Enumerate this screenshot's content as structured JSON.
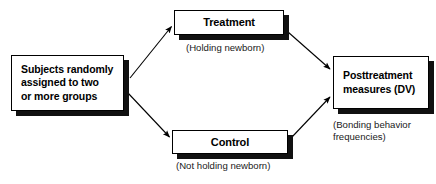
{
  "diagram": {
    "type": "flow-diagram",
    "background_color": "#ffffff",
    "line_color": "#000000",
    "box_fill": "#ffffff",
    "box_border": "#000000",
    "box_shadow_color": "#111111",
    "nodes": [
      {
        "id": "subjects",
        "label": "Subjects randomly\nassigned to two\nor more groups",
        "align": "left"
      },
      {
        "id": "treatment",
        "label": "Treatment",
        "align": "center"
      },
      {
        "id": "control",
        "label": "Control",
        "align": "center"
      },
      {
        "id": "posttreatment",
        "label": "Posttreatment\nmeasures (DV)",
        "align": "left"
      }
    ],
    "captions": [
      {
        "id": "treatment-caption",
        "text": "(Holding newborn)",
        "for": "treatment"
      },
      {
        "id": "control-caption",
        "text": "(Not holding newborn)",
        "for": "control"
      },
      {
        "id": "posttreatment-caption",
        "text": "(Bonding behavior\nfrequencies)",
        "for": "posttreatment"
      }
    ],
    "edges": [
      {
        "id": "subjects-to-treatment",
        "from": "subjects",
        "to": "treatment",
        "style": "arrow"
      },
      {
        "id": "subjects-to-control",
        "from": "subjects",
        "to": "control",
        "style": "arrow"
      },
      {
        "id": "treatment-to-posttreatment",
        "from": "treatment",
        "to": "posttreatment",
        "style": "arrow"
      },
      {
        "id": "control-to-posttreatment",
        "from": "control",
        "to": "posttreatment",
        "style": "arrow"
      }
    ]
  }
}
